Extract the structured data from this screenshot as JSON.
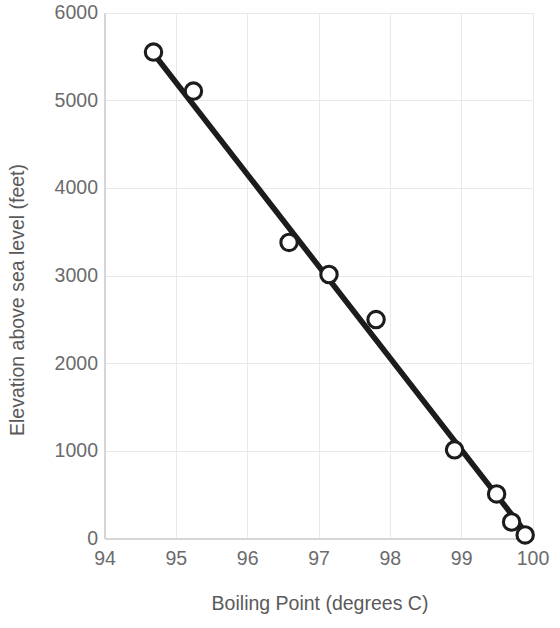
{
  "chart_data": {
    "type": "scatter",
    "title": "",
    "xlabel": "Boiling Point (degrees C)",
    "ylabel": "Elevation above sea level (feet)",
    "xlim": [
      94,
      100
    ],
    "ylim": [
      0,
      6000
    ],
    "xticks": [
      "94",
      "95",
      "96",
      "97",
      "98",
      "99",
      "100"
    ],
    "xtick_values": [
      94,
      95,
      96,
      97,
      98,
      99,
      100
    ],
    "yticks": [
      "0",
      "1000",
      "2000",
      "3000",
      "4000",
      "5000",
      "6000"
    ],
    "ytick_values": [
      0,
      1000,
      2000,
      3000,
      4000,
      5000,
      6000
    ],
    "grid": true,
    "legend": "none",
    "marker_style": "open-circle",
    "series": [
      {
        "name": "Boiling point vs elevation",
        "points": [
          {
            "x": 94.68,
            "y": 5554
          },
          {
            "x": 95.24,
            "y": 5109
          },
          {
            "x": 96.58,
            "y": 3383
          },
          {
            "x": 97.14,
            "y": 3017
          },
          {
            "x": 97.8,
            "y": 2503
          },
          {
            "x": 98.9,
            "y": 1017
          },
          {
            "x": 99.49,
            "y": 514
          },
          {
            "x": 99.7,
            "y": 194
          },
          {
            "x": 99.89,
            "y": 46
          }
        ]
      }
    ],
    "trendline": {
      "type": "linear",
      "x_start": 94.62,
      "y_start": 5600,
      "x_end": 99.93,
      "y_end": 40,
      "color": "#1c1c1c"
    },
    "colors": {
      "line": "#1c1c1c",
      "marker_fill": "#ffffff",
      "marker_stroke": "#1c1c1c",
      "grid": "#e9e9e9",
      "axis": "#d6d6d6",
      "tick_text": "#6b6b6b",
      "label_text": "#5a5a5a",
      "background": "#ffffff"
    }
  }
}
